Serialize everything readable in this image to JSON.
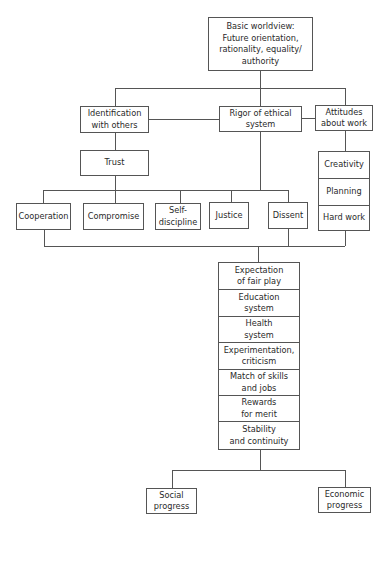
{
  "diagram": {
    "root": {
      "label": "Basic worldview:\nFuture orientation,\nrationality, equality/\nauthority"
    },
    "level2": [
      {
        "label": "Identification\nwith others"
      },
      {
        "label": "Rigor of ethical\nsystem"
      },
      {
        "label": "Attitudes\nabout work"
      }
    ],
    "trust": {
      "label": "Trust"
    },
    "work_attitudes": [
      {
        "label": "Creativity"
      },
      {
        "label": "Planning"
      },
      {
        "label": "Hard work"
      }
    ],
    "values": [
      {
        "label": "Cooperation"
      },
      {
        "label": "Compromise"
      },
      {
        "label": "Self-\ndiscipline"
      },
      {
        "label": "Justice"
      },
      {
        "label": "Dissent"
      }
    ],
    "institutions": [
      {
        "label": "Expectation\nof fair play"
      },
      {
        "label": "Education\nsystem"
      },
      {
        "label": "Health\nsystem"
      },
      {
        "label": "Experimentation,\ncriticism"
      },
      {
        "label": "Match of skills\nand jobs"
      },
      {
        "label": "Rewards\nfor merit"
      },
      {
        "label": "Stability\nand continuity"
      }
    ],
    "outcomes": [
      {
        "label": "Social\nprogress"
      },
      {
        "label": "Economic\nprogress"
      }
    ]
  }
}
